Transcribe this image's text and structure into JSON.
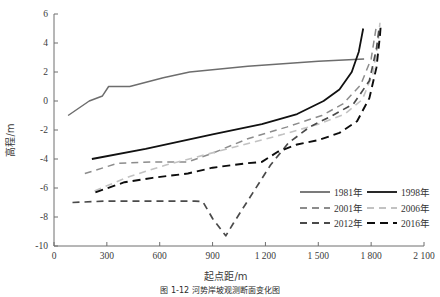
{
  "figure": {
    "caption": "图 1-12  河势岸坡观测断面变化图"
  },
  "chart_data": {
    "type": "line",
    "title": "",
    "xlabel": "起点距/m",
    "ylabel": "高程/m",
    "xlim": [
      0,
      2100
    ],
    "ylim": [
      -10,
      6
    ],
    "xticks": [
      0,
      300,
      600,
      900,
      1200,
      1500,
      1800,
      2100
    ],
    "xticklabels": [
      "0",
      "300",
      "600",
      "900",
      "1 200",
      "1 500",
      "1 800",
      "2 100"
    ],
    "yticks": [
      -10,
      -8,
      -6,
      -4,
      -2,
      0,
      2,
      4,
      6
    ],
    "yticklabels": [
      "-10",
      "-8",
      "-6",
      "-4",
      "-2",
      "0",
      "2",
      "4",
      "6"
    ],
    "grid": false,
    "legend_position": "lower-right",
    "series": [
      {
        "name": "1981年",
        "color": "#6d6d6d",
        "dash": "none",
        "width": 1.5,
        "points": [
          [
            80,
            -1.0
          ],
          [
            200,
            0.0
          ],
          [
            275,
            0.35
          ],
          [
            310,
            1.0
          ],
          [
            430,
            1.0
          ],
          [
            620,
            1.6
          ],
          [
            770,
            2.0
          ],
          [
            1100,
            2.4
          ],
          [
            1500,
            2.75
          ],
          [
            1760,
            2.9
          ]
        ]
      },
      {
        "name": "1998年",
        "color": "#111111",
        "dash": "none",
        "width": 1.8,
        "points": [
          [
            215,
            -4.0
          ],
          [
            520,
            -3.3
          ],
          [
            900,
            -2.3
          ],
          [
            1180,
            -1.6
          ],
          [
            1380,
            -0.9
          ],
          [
            1530,
            0.0
          ],
          [
            1620,
            0.8
          ],
          [
            1690,
            2.0
          ],
          [
            1730,
            3.4
          ],
          [
            1755,
            5.0
          ]
        ]
      },
      {
        "name": "2001年",
        "color": "#8c8c8c",
        "dash": "7,5",
        "width": 1.5,
        "points": [
          [
            175,
            -5.0
          ],
          [
            360,
            -4.3
          ],
          [
            560,
            -4.2
          ],
          [
            760,
            -4.2
          ],
          [
            900,
            -3.6
          ],
          [
            1100,
            -2.6
          ],
          [
            1320,
            -1.8
          ],
          [
            1520,
            -1.0
          ],
          [
            1640,
            -0.2
          ],
          [
            1740,
            1.1
          ],
          [
            1800,
            2.9
          ],
          [
            1830,
            5.2
          ]
        ]
      },
      {
        "name": "2006年",
        "color": "#c2c2c2",
        "dash": "7,5",
        "width": 1.6,
        "points": [
          [
            230,
            -6.2
          ],
          [
            430,
            -5.2
          ],
          [
            640,
            -4.4
          ],
          [
            860,
            -3.7
          ],
          [
            1080,
            -3.0
          ],
          [
            1300,
            -2.3
          ],
          [
            1500,
            -1.6
          ],
          [
            1650,
            -0.9
          ],
          [
            1750,
            0.1
          ],
          [
            1810,
            1.9
          ],
          [
            1840,
            4.1
          ],
          [
            1850,
            5.4
          ]
        ]
      },
      {
        "name": "2012年",
        "color": "#4a4a4a",
        "dash": "7,5",
        "width": 1.7,
        "points": [
          [
            105,
            -7.0
          ],
          [
            300,
            -6.9
          ],
          [
            560,
            -6.9
          ],
          [
            800,
            -6.9
          ],
          [
            845,
            -6.95
          ],
          [
            900,
            -8.1
          ],
          [
            975,
            -9.3
          ],
          [
            1020,
            -8.4
          ],
          [
            1130,
            -6.3
          ],
          [
            1230,
            -4.4
          ],
          [
            1330,
            -2.9
          ],
          [
            1450,
            -1.8
          ],
          [
            1580,
            -1.0
          ],
          [
            1700,
            -0.2
          ],
          [
            1790,
            1.4
          ],
          [
            1830,
            3.6
          ],
          [
            1845,
            5.0
          ]
        ]
      },
      {
        "name": "2016年",
        "color": "#0d0d0d",
        "dash": "8,5",
        "width": 1.9,
        "points": [
          [
            235,
            -6.3
          ],
          [
            400,
            -5.6
          ],
          [
            560,
            -5.3
          ],
          [
            760,
            -5.0
          ],
          [
            900,
            -4.6
          ],
          [
            1090,
            -4.3
          ],
          [
            1180,
            -4.2
          ],
          [
            1270,
            -3.5
          ],
          [
            1380,
            -3.0
          ],
          [
            1500,
            -2.7
          ],
          [
            1620,
            -2.2
          ],
          [
            1720,
            -1.4
          ],
          [
            1790,
            0.2
          ],
          [
            1830,
            2.3
          ],
          [
            1850,
            4.5
          ],
          [
            1855,
            5.3
          ]
        ]
      }
    ],
    "legend": [
      {
        "label": "1981年",
        "color": "#6d6d6d",
        "dash": "none"
      },
      {
        "label": "1998年",
        "color": "#111111",
        "dash": "none"
      },
      {
        "label": "2001年",
        "color": "#8c8c8c",
        "dash": "7,5"
      },
      {
        "label": "2006年",
        "color": "#c2c2c2",
        "dash": "7,5"
      },
      {
        "label": "2012年",
        "color": "#4a4a4a",
        "dash": "7,5"
      },
      {
        "label": "2016年",
        "color": "#0d0d0d",
        "dash": "8,5"
      }
    ]
  }
}
